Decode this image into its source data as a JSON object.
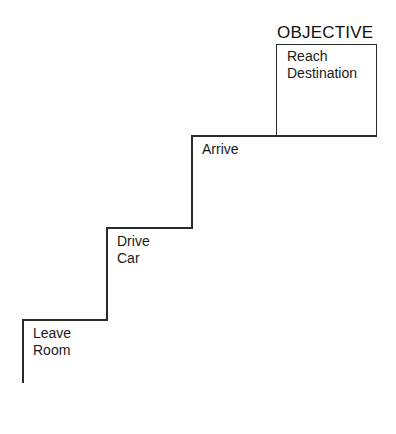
{
  "diagram": {
    "type": "staircase",
    "objective": {
      "title": "OBJECTIVE",
      "label_line1": "Reach",
      "label_line2": "Destination"
    },
    "steps": [
      {
        "line1": "Leave",
        "line2": "Room"
      },
      {
        "line1": "Drive",
        "line2": "Car"
      },
      {
        "line1": "Arrive",
        "line2": ""
      }
    ],
    "colors": {
      "line": "#2a2a2a",
      "text": "#1a1a1a",
      "background": "#ffffff"
    }
  }
}
